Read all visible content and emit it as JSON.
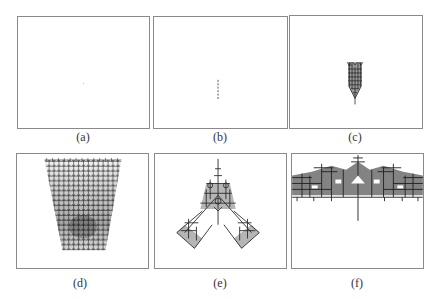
{
  "figure": {
    "panels": [
      {
        "id": "a",
        "label": "(a)",
        "content": "single seed point"
      },
      {
        "id": "b",
        "label": "(b)",
        "content": "short vertical dashed stem"
      },
      {
        "id": "c",
        "label": "(c)",
        "content": "small dense branching cluster"
      },
      {
        "id": "d",
        "label": "(d)",
        "content": "wide dense inverted-trapezoid lattice"
      },
      {
        "id": "e",
        "label": "(e)",
        "content": "triangular fractal with diagonal arms"
      },
      {
        "id": "f",
        "label": "(f)",
        "content": "wide canopy fractal with central trunk"
      }
    ],
    "colors": {
      "border": "#8a8a8a",
      "ink": "#2a2a2a",
      "background": "#ffffff"
    }
  }
}
